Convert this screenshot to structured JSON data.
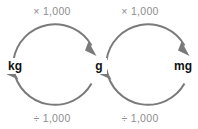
{
  "diagram": {
    "background_color": "#ffffff",
    "arc_color": "#7a7a7a",
    "unit_label_color": "#111111",
    "operation_label_color": "#8d8d8d",
    "units": [
      {
        "id": "kg",
        "label": "kg",
        "x": 14,
        "y": 69
      },
      {
        "id": "g",
        "label": "g",
        "x": 99,
        "y": 69
      },
      {
        "id": "mg",
        "label": "mg",
        "x": 184,
        "y": 69
      }
    ],
    "cycles": [
      {
        "id": "kg-g",
        "from": "kg",
        "to": "g",
        "multiply_label": "× 1,000",
        "divide_label": "÷ 1,000",
        "multiply_label_x": 52,
        "multiply_label_y": 15,
        "divide_label_x": 52,
        "divide_label_y": 122
      },
      {
        "id": "g-mg",
        "from": "g",
        "to": "mg",
        "multiply_label": "× 1,000",
        "divide_label": "÷ 1,000",
        "multiply_label_x": 140,
        "multiply_label_y": 15,
        "divide_label_x": 140,
        "divide_label_y": 122
      }
    ]
  }
}
